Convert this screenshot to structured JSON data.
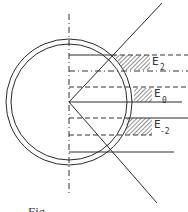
{
  "diagram": {
    "type": "energy-level-circle-diagram",
    "colors": {
      "line": "#2a2a2a",
      "hatch": "#555555",
      "background": "#ffffff"
    },
    "labels": [
      {
        "id": "E2",
        "base": "E",
        "sub": "2"
      },
      {
        "id": "E0",
        "base": "E",
        "sub": "0"
      },
      {
        "id": "Em2",
        "base": "E",
        "sub": "-2"
      }
    ],
    "caption_partial": "Fig..."
  }
}
